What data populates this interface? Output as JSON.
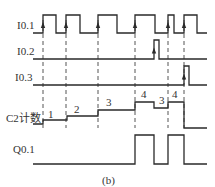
{
  "figure": {
    "caption": "(b)",
    "colors": {
      "line": "#2a2a2a",
      "text": "#333333",
      "background": "#ffffff"
    }
  },
  "signals": [
    {
      "id": "i01",
      "label": "I0.1",
      "low_y": 33,
      "high_y": 15,
      "start_x": 33,
      "end_x": 207,
      "pulses": [
        [
          43,
          56
        ],
        [
          66,
          80
        ],
        [
          98,
          117
        ],
        [
          135,
          155
        ],
        [
          168,
          174
        ],
        [
          184,
          197
        ]
      ]
    },
    {
      "id": "i02",
      "label": "I0.2",
      "low_y": 59,
      "high_y": 40,
      "start_x": 33,
      "end_x": 207,
      "pulses": [
        [
          154,
          159
        ]
      ]
    },
    {
      "id": "i03",
      "label": "I0.3",
      "low_y": 85,
      "high_y": 66,
      "start_x": 33,
      "end_x": 207,
      "pulses": [
        [
          184,
          189
        ]
      ]
    },
    {
      "id": "c2",
      "label": "C2计数",
      "type": "counter",
      "steps": [
        {
          "x0": 33,
          "x1": 43,
          "y": 124,
          "value": ""
        },
        {
          "x0": 43,
          "x1": 67,
          "y": 120,
          "value": "1"
        },
        {
          "x0": 67,
          "x1": 98,
          "y": 116,
          "value": "2"
        },
        {
          "x0": 98,
          "x1": 135,
          "y": 110,
          "value": "3"
        },
        {
          "x0": 135,
          "x1": 154,
          "y": 102,
          "value": "4"
        },
        {
          "x0": 154,
          "x1": 168,
          "y": 108,
          "value": "3"
        },
        {
          "x0": 168,
          "x1": 184,
          "y": 102,
          "value": "4"
        },
        {
          "x0": 184,
          "x1": 207,
          "y": 128,
          "value": ""
        }
      ]
    },
    {
      "id": "q01",
      "label": "Q0.1",
      "low_y": 164,
      "high_y": 135,
      "start_x": 33,
      "end_x": 207,
      "pulses": [
        [
          135,
          154
        ],
        [
          168,
          184
        ]
      ]
    }
  ],
  "dashed_guides": {
    "xs": [
      43,
      66,
      98,
      135,
      168,
      184
    ],
    "y_top": 20,
    "y_bottom": 128
  },
  "labels": {
    "i01": "I0.1",
    "i02": "I0.2",
    "i03": "I0.3",
    "c2": "C2计数",
    "q01": "Q0.1"
  },
  "counter_values": [
    "1",
    "2",
    "3",
    "4",
    "3",
    "4"
  ]
}
